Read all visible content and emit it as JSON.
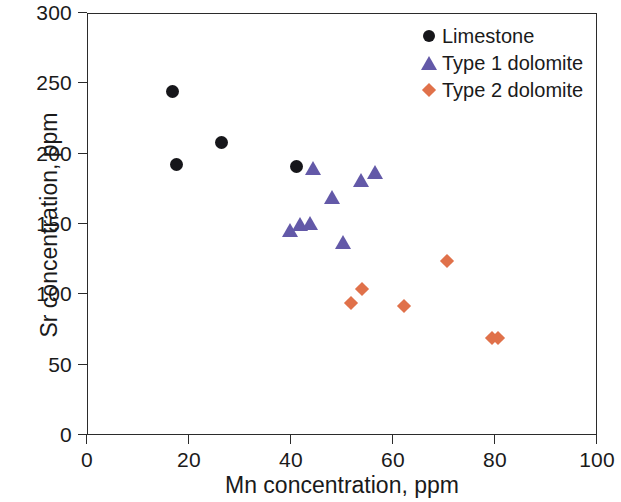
{
  "chart_data": {
    "type": "scatter",
    "title": "",
    "xlabel": "Mn concentration, ppm",
    "ylabel": "Sr concentration, ppm",
    "xlim": [
      0,
      100
    ],
    "ylim": [
      0,
      300
    ],
    "xticks": [
      "0",
      "20",
      "40",
      "60",
      "80",
      "100"
    ],
    "yticks": [
      "0",
      "50",
      "100",
      "150",
      "200",
      "250",
      "300"
    ],
    "xtick_values": [
      0,
      20,
      40,
      60,
      80,
      100
    ],
    "ytick_values": [
      0,
      50,
      100,
      150,
      200,
      250,
      300
    ],
    "grid": false,
    "legend_position": "top-right",
    "series": [
      {
        "name": "Limestone",
        "marker": "circle",
        "color": "#16161a",
        "points": [
          {
            "x": 16.7,
            "y": 244
          },
          {
            "x": 17.5,
            "y": 192
          },
          {
            "x": 26.3,
            "y": 208
          },
          {
            "x": 41.0,
            "y": 191
          }
        ]
      },
      {
        "name": "Type 1 dolomite",
        "marker": "triangle",
        "color": "#6359a8",
        "points": [
          {
            "x": 39.8,
            "y": 146
          },
          {
            "x": 41.8,
            "y": 150
          },
          {
            "x": 43.7,
            "y": 151
          },
          {
            "x": 44.3,
            "y": 190
          },
          {
            "x": 48.0,
            "y": 169
          },
          {
            "x": 50.2,
            "y": 137
          },
          {
            "x": 53.7,
            "y": 181
          },
          {
            "x": 56.5,
            "y": 187
          }
        ]
      },
      {
        "name": "Type 2 dolomite",
        "marker": "diamond",
        "color": "#e0714a",
        "points": [
          {
            "x": 51.8,
            "y": 94
          },
          {
            "x": 54.0,
            "y": 104
          },
          {
            "x": 62.2,
            "y": 92
          },
          {
            "x": 70.6,
            "y": 124
          },
          {
            "x": 79.4,
            "y": 69
          },
          {
            "x": 80.6,
            "y": 69
          }
        ]
      }
    ]
  },
  "legend": {
    "entries": [
      {
        "label": "Limestone",
        "marker": "circle"
      },
      {
        "label": "Type 1 dolomite",
        "marker": "triangle"
      },
      {
        "label": "Type 2 dolomite",
        "marker": "diamond"
      }
    ]
  }
}
